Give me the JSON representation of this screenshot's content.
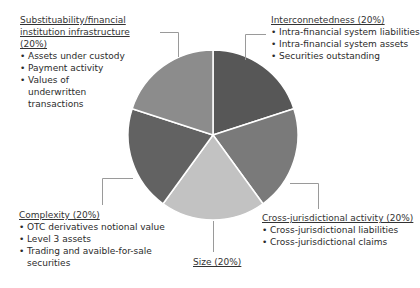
{
  "chart_data": {
    "type": "pie",
    "title": "",
    "categories": [
      "Interconnetedness",
      "Cross-jurisdictional activity",
      "Size",
      "Complexity",
      "Substituability/financial institution infrastructure"
    ],
    "values": [
      20,
      20,
      20,
      20,
      20
    ],
    "colors": [
      "#575757",
      "#7a7a7a",
      "#c2c2c2",
      "#626262",
      "#8c8c8c"
    ],
    "legend_position": "callout labels around pie"
  },
  "labels": {
    "substituability": {
      "title": "Substituability/financial institution infrastructure (20%)",
      "items": [
        "Assets under custody",
        "Payment activity",
        "Values of underwritten transactions"
      ]
    },
    "interconnectedness": {
      "title": "Interconnetedness (20%)",
      "items": [
        "Intra-financial system liabilities",
        "Intra-financial system assets",
        "Securities outstanding"
      ]
    },
    "cross_jurisdictional": {
      "title": "Cross-jurisdictional activity (20%)",
      "items": [
        "Cross-jurisdictional liabilities",
        "Cross-jurisdictional claims"
      ]
    },
    "size": {
      "title": "Size (20%)"
    },
    "complexity": {
      "title": "Complexity (20%)",
      "items": [
        "OTC derivatives notional value",
        "Level 3 assets",
        "Trading and avaible-for-sale securities"
      ]
    }
  }
}
